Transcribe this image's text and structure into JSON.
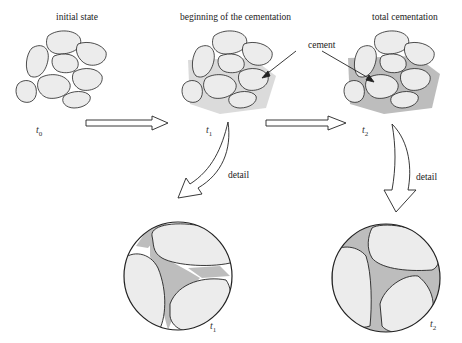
{
  "stages": [
    {
      "label": "initial state",
      "time": "t",
      "time_sub": "0"
    },
    {
      "label": "beginning of the cementation",
      "time": "t",
      "time_sub": "1"
    },
    {
      "label": "total cementation",
      "time": "t",
      "time_sub": "2"
    }
  ],
  "annotations": {
    "cement": "cement",
    "detail_1": "detail",
    "detail_2": "detail"
  },
  "details": [
    {
      "time": "t",
      "time_sub": "1"
    },
    {
      "time": "t",
      "time_sub": "2"
    }
  ],
  "colors": {
    "grain": "#ececec",
    "cement": "#bdbdbd",
    "outline": "#222222",
    "background": "#ffffff"
  }
}
